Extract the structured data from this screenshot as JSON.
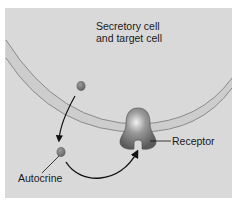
{
  "diagram": {
    "title_line1": "Secretory cell",
    "title_line2": "and target cell",
    "labels": {
      "receptor": "Receptor",
      "autocrine": "Autocrine"
    },
    "colors": {
      "background": "#d9d9d9",
      "membrane": "#c9c9c9",
      "membrane_edge": "#8a8a8a",
      "molecule": "#6f6f6f",
      "receptor": "#6a6a6a",
      "arrow": "#111111"
    }
  }
}
